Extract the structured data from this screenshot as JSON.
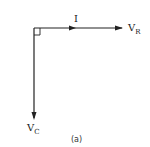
{
  "diagram": {
    "type": "phasor-diagram",
    "caption": "(a)",
    "vectors": [
      {
        "name": "I",
        "direction": "horizontal-right",
        "label": "I"
      },
      {
        "name": "V_R",
        "direction": "horizontal-right",
        "label_main": "V",
        "label_sub": "R"
      },
      {
        "name": "V_C",
        "direction": "vertical-down",
        "label_main": "V",
        "label_sub": "C"
      }
    ],
    "right_angle_marker": true,
    "colors": {
      "line": "#222222",
      "background": "#ffffff"
    }
  }
}
